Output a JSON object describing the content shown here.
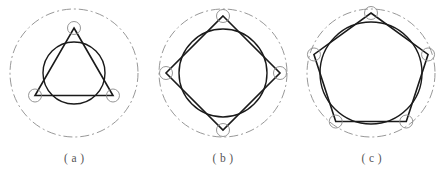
{
  "figure": {
    "background_color": "#ffffff",
    "panel_count": 3,
    "stroke_colors": {
      "outer_pitch_circle": "#8c8c8c",
      "vertex_circle": "#8a8a8a",
      "polygon": "#1a1a1a",
      "inner_circle": "#1a1a1a",
      "caption_text": "#555555"
    },
    "stroke_widths": {
      "outer_pitch_circle": 0.9,
      "vertex_circle": 0.9,
      "polygon": 1.6,
      "inner_circle": 1.4
    },
    "outer_circle_dash_pattern": "9 3 2 3",
    "panels": [
      {
        "id": "panel-a",
        "caption": "( a )",
        "sides": 3,
        "shape_name": "triangle",
        "center_x": 74,
        "center_y": 73,
        "outer_radius": 64,
        "vertex_radius": 45,
        "vertex_circle_radius": 6.5,
        "inner_circle_radius": 31,
        "start_angle_deg": -90
      },
      {
        "id": "panel-b",
        "caption": "( b )",
        "sides": 4,
        "shape_name": "square",
        "center_x": 223,
        "center_y": 73,
        "outer_radius": 64,
        "vertex_radius": 57,
        "vertex_circle_radius": 6.5,
        "inner_circle_radius": 44,
        "start_angle_deg": -90
      },
      {
        "id": "panel-c",
        "caption": "( c )",
        "sides": 5,
        "shape_name": "pentagon",
        "center_x": 371,
        "center_y": 73,
        "outer_radius": 64,
        "vertex_radius": 60,
        "vertex_circle_radius": 6.5,
        "inner_circle_radius": 51,
        "start_angle_deg": -90
      }
    ],
    "captions": [
      "( a )",
      "( b )",
      "( c )"
    ]
  },
  "chart_data": {
    "type": "diagram",
    "title": "",
    "panels": [
      {
        "label": "( a )",
        "polygon_sides": 3,
        "vertex_circle_count": 3,
        "inner_circle_count": 1,
        "outer_circle_style": "dash-dot"
      },
      {
        "label": "( b )",
        "polygon_sides": 4,
        "vertex_circle_count": 4,
        "inner_circle_count": 1,
        "outer_circle_style": "dash-dot"
      },
      {
        "label": "( c )",
        "polygon_sides": 5,
        "vertex_circle_count": 5,
        "inner_circle_count": 1,
        "outer_circle_style": "dash-dot"
      }
    ]
  }
}
